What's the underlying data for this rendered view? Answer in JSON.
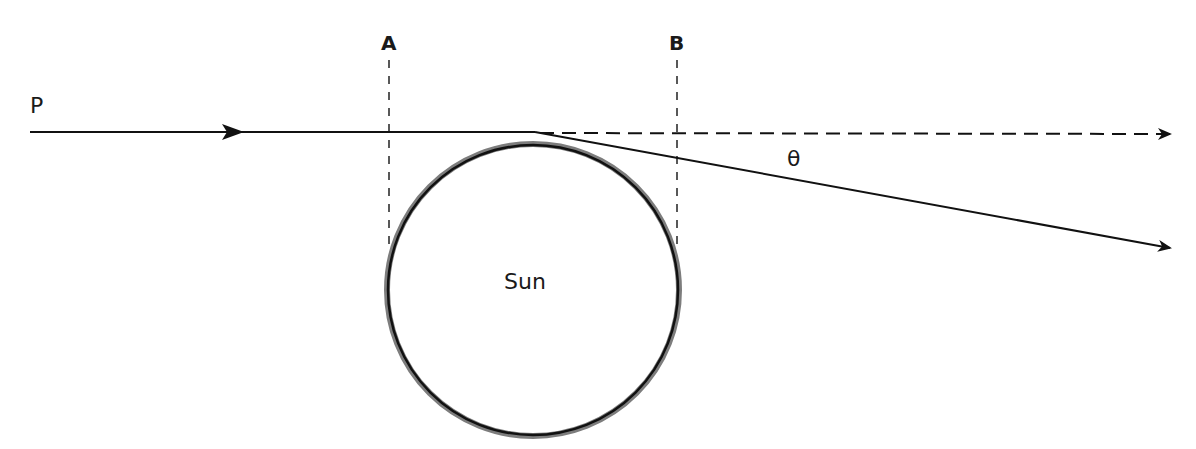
{
  "diagram": {
    "labels": {
      "point_p": "P",
      "line_a": "A",
      "line_b": "B",
      "angle": "θ",
      "sun": "Sun"
    },
    "elements": {
      "incoming_ray": {
        "from": [
          30,
          132
        ],
        "to": [
          535,
          132
        ],
        "style": "solid",
        "arrow_at": [
          240,
          132
        ]
      },
      "undeflected_ray": {
        "from": [
          535,
          132
        ],
        "to": [
          1172,
          134
        ],
        "style": "dashed",
        "arrow": "end"
      },
      "deflected_ray": {
        "from": [
          535,
          132
        ],
        "to": [
          1172,
          248
        ],
        "style": "solid",
        "arrow": "end"
      },
      "sun_circle": {
        "cx": 533,
        "cy": 290,
        "r": 146
      },
      "dashed_line_a": {
        "x": 389,
        "y1": 60,
        "y2": 250
      },
      "dashed_line_b": {
        "x": 677,
        "y1": 60,
        "y2": 250
      }
    },
    "colors": {
      "stroke": "#111111",
      "sun_outline_outer": "#7a7a7a",
      "sun_outline_inner": "#111111",
      "background": "#ffffff"
    }
  }
}
